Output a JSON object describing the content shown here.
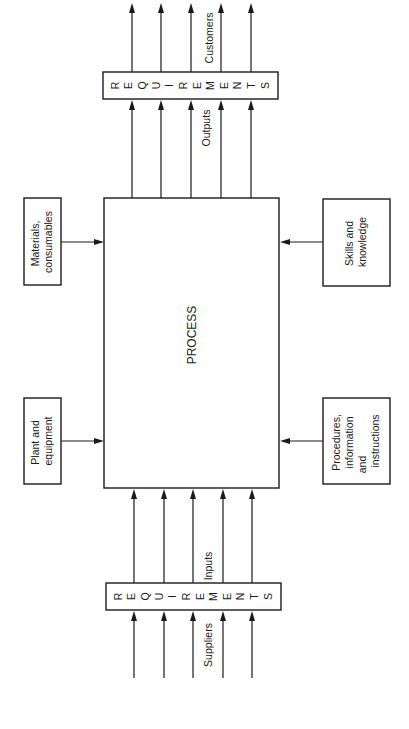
{
  "diagram": {
    "orientation": "rotated-90-ccw",
    "process": {
      "label": "PROCESS"
    },
    "requirements_top": {
      "letters": [
        "R",
        "E",
        "Q",
        "U",
        "I",
        "R",
        "E",
        "M",
        "E",
        "N",
        "T",
        "S"
      ],
      "word": "REQUIREMENTS"
    },
    "requirements_bottom": {
      "letters": [
        "R",
        "E",
        "Q",
        "U",
        "I",
        "R",
        "E",
        "M",
        "E",
        "N",
        "T",
        "S"
      ],
      "word": "REQUIREMENTS"
    },
    "labels": {
      "customers": "Customers",
      "outputs": "Outputs",
      "inputs": "Inputs",
      "suppliers": "Suppliers"
    },
    "resources_left": [
      {
        "id": "materials",
        "lines": [
          "Materials,",
          "consumables"
        ]
      },
      {
        "id": "plant",
        "lines": [
          "Plant and",
          "equipment"
        ]
      }
    ],
    "resources_right": [
      {
        "id": "skills",
        "lines": [
          "Skills and",
          "knowledge"
        ]
      },
      {
        "id": "procedures",
        "lines": [
          "Procedures,",
          "information",
          "and",
          "instructions"
        ]
      }
    ],
    "arrow_count_per_flow": 5
  }
}
